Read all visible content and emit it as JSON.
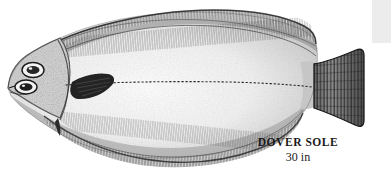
{
  "figure": {
    "kind": "field-guide-illustration",
    "background_color": "#ffffff",
    "ink_color": "#1a1a1a",
    "caption": {
      "common_name": "DOVER SOLE",
      "size": "30 in"
    },
    "anatomy_labels": {
      "head": "head",
      "upper_eye": "upper-eye",
      "lower_eye": "lower-eye",
      "mouth": "mouth",
      "gill_cover": "gill-cover",
      "pectoral_fin": "pectoral-fin",
      "pelvic_fin": "pelvic-fin",
      "dorsal_fin": "dorsal-fin",
      "anal_fin": "anal-fin",
      "caudal_peduncle": "caudal-peduncle",
      "caudal_fin": "caudal-fin",
      "lateral_line": "lateral-line",
      "body": "body"
    }
  },
  "corner_block": {
    "color": "#ececec"
  }
}
